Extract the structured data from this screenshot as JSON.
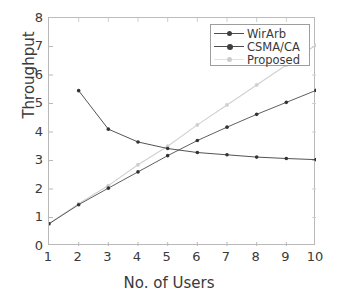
{
  "chart_data": {
    "type": "line",
    "title": "",
    "xlabel": "No. of Users",
    "ylabel": "Throughput",
    "x": [
      1,
      2,
      3,
      4,
      5,
      6,
      7,
      8,
      9,
      10
    ],
    "xlim": [
      1,
      10
    ],
    "ylim": [
      0,
      8
    ],
    "xticks": [
      "1",
      "2",
      "3",
      "4",
      "5",
      "6",
      "7",
      "8",
      "9",
      "10"
    ],
    "yticks": [
      "0",
      "1",
      "2",
      "3",
      "4",
      "5",
      "6",
      "7",
      "8"
    ],
    "grid": false,
    "legend_position": "upper right",
    "series": [
      {
        "name": "WirArb",
        "color": "#4d4d4d",
        "marker": "dot",
        "x": [
          1,
          2,
          3,
          4,
          5,
          6,
          7,
          8,
          9,
          10
        ],
        "values": [
          0.78,
          1.45,
          2.03,
          2.6,
          3.17,
          3.7,
          4.17,
          4.62,
          5.04,
          5.46
        ]
      },
      {
        "name": "CSMA/CA",
        "color": "#3f3f3f",
        "marker": "dot",
        "x": [
          2,
          3,
          4,
          5,
          6,
          7,
          8,
          9,
          10
        ],
        "values": [
          5.45,
          4.1,
          3.65,
          3.42,
          3.28,
          3.2,
          3.12,
          3.07,
          3.03
        ]
      },
      {
        "name": "Proposed",
        "color": "#d0d0d0",
        "marker": "dot",
        "x": [
          1,
          2,
          3,
          4,
          5,
          6,
          7,
          8,
          9,
          10
        ],
        "values": [
          0.78,
          1.48,
          2.12,
          2.85,
          3.5,
          4.25,
          4.95,
          5.65,
          6.35,
          7.05
        ]
      }
    ]
  },
  "legend": {
    "items": [
      {
        "label": "WirArb"
      },
      {
        "label": "CSMA/CA"
      },
      {
        "label": "Proposed"
      }
    ]
  },
  "axes": {
    "x_title": "No. of Users",
    "y_title": "Throughput"
  }
}
